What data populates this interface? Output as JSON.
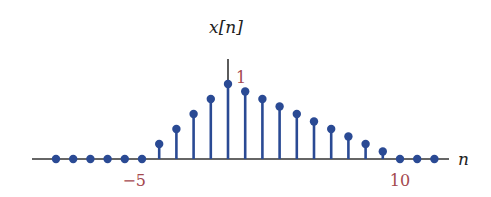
{
  "chart_data": {
    "type": "stem",
    "title": "",
    "ylabel": "x[n]",
    "xlabel": "n",
    "x": [
      -10,
      -9,
      -8,
      -7,
      -6,
      -5,
      -4,
      -3,
      -2,
      -1,
      0,
      1,
      2,
      3,
      4,
      5,
      6,
      7,
      8,
      9,
      10,
      11,
      12
    ],
    "values": [
      0,
      0,
      0,
      0,
      0,
      0,
      0.2,
      0.4,
      0.6,
      0.8,
      1.0,
      0.9,
      0.8,
      0.7,
      0.6,
      0.5,
      0.4,
      0.3,
      0.2,
      0.1,
      0,
      0,
      0
    ],
    "x_tick_labels": [
      {
        "value": -5,
        "label": "−5"
      },
      {
        "value": 10,
        "label": "10"
      }
    ],
    "y_tick_labels": [
      {
        "value": 1,
        "label": "1"
      }
    ],
    "xlim": [
      -11.3,
      12.9
    ],
    "ylim": [
      0,
      1.33
    ],
    "grid": false,
    "legend": null,
    "colors": {
      "stem": "#2a4a94",
      "marker": "#2a4a94",
      "axis": "#333333",
      "tick_label": "#a4484e",
      "axis_label": "#222222"
    }
  }
}
